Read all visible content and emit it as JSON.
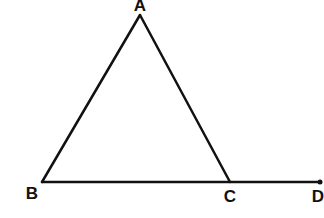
{
  "diagram": {
    "type": "geometry",
    "colors": {
      "stroke": "#111111",
      "background": "#ffffff"
    },
    "points": {
      "A": {
        "label": "A",
        "x": 140,
        "y": 15
      },
      "B": {
        "label": "B",
        "x": 42,
        "y": 182
      },
      "C": {
        "label": "C",
        "x": 230,
        "y": 182
      },
      "D": {
        "label": "D",
        "x": 320,
        "y": 182
      }
    },
    "segments": [
      {
        "from": "A",
        "to": "B"
      },
      {
        "from": "A",
        "to": "C"
      },
      {
        "from": "B",
        "to": "D"
      }
    ],
    "labels": [
      {
        "text": "A",
        "x": 140,
        "y": -3
      },
      {
        "text": "B",
        "x": 32,
        "y": 185
      },
      {
        "text": "C",
        "x": 230,
        "y": 188
      },
      {
        "text": "D",
        "x": 318,
        "y": 188
      }
    ]
  }
}
